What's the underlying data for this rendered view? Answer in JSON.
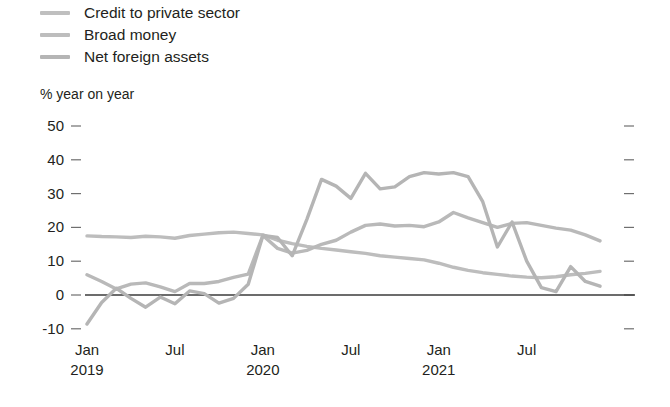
{
  "legend": {
    "position": "top-left",
    "items": [
      {
        "label": "Credit to private sector",
        "color": "#bfbfbf",
        "swatch_name": "legend-swatch-credit"
      },
      {
        "label": "Broad money",
        "color": "#bdbdbd",
        "swatch_name": "legend-swatch-broad-money"
      },
      {
        "label": "Net foreign assets",
        "color": "#b5b5b5",
        "swatch_name": "legend-swatch-net-foreign-assets"
      }
    ]
  },
  "axis_caption": "% year on year",
  "chart_data": {
    "type": "line",
    "title": "",
    "subtitle": "",
    "xlabel": "",
    "ylabel": "% year on year",
    "ylim": [
      -10,
      50
    ],
    "yticks": [
      50,
      40,
      30,
      20,
      10,
      0,
      -10
    ],
    "ytick_labels": [
      "50",
      "40",
      "30",
      "20",
      "10",
      "0",
      "-10"
    ],
    "grid": false,
    "zero_line": true,
    "right_ticks": true,
    "legend_position": "top-left",
    "x_tick_labels": [
      "Jan",
      "Jul",
      "Jan",
      "Jul",
      "Jan",
      "Jul"
    ],
    "x_tick_years": [
      "2019",
      "",
      "2020",
      "",
      "2021",
      ""
    ],
    "x": [
      "2019-01",
      "2019-02",
      "2019-03",
      "2019-04",
      "2019-05",
      "2019-06",
      "2019-07",
      "2019-08",
      "2019-09",
      "2019-10",
      "2019-11",
      "2019-12",
      "2020-01",
      "2020-02",
      "2020-03",
      "2020-04",
      "2020-05",
      "2020-06",
      "2020-07",
      "2020-08",
      "2020-09",
      "2020-10",
      "2020-11",
      "2020-12",
      "2021-01",
      "2021-02",
      "2021-03",
      "2021-04",
      "2021-05",
      "2021-06",
      "2021-07",
      "2021-08",
      "2021-09",
      "2021-10",
      "2021-11",
      "2021-12"
    ],
    "series": [
      {
        "name": "Credit to private sector",
        "color": "#bdbdbd",
        "values": [
          17.5,
          17.3,
          17.2,
          17.0,
          17.4,
          17.2,
          16.8,
          17.6,
          18.0,
          18.4,
          18.6,
          18.2,
          17.8,
          16.2,
          15.2,
          14.4,
          13.8,
          13.3,
          12.8,
          12.3,
          11.6,
          11.2,
          10.8,
          10.4,
          9.4,
          8.2,
          7.3,
          6.6,
          6.1,
          5.6,
          5.3,
          5.1,
          5.4,
          6.0,
          6.4,
          7.0
        ]
      },
      {
        "name": "Broad money",
        "color": "#b9b9b9",
        "values": [
          6.0,
          4.0,
          1.8,
          3.2,
          3.6,
          2.4,
          1.0,
          3.4,
          3.4,
          4.0,
          5.2,
          6.2,
          17.6,
          13.8,
          12.4,
          13.2,
          15.0,
          16.2,
          18.6,
          20.6,
          21.0,
          20.4,
          20.6,
          20.2,
          21.6,
          24.4,
          22.8,
          21.4,
          20.0,
          21.2,
          21.4,
          20.6,
          19.8,
          19.2,
          17.8,
          16.0
        ]
      },
      {
        "name": "Net foreign assets",
        "color": "#b5b5b5",
        "values": [
          -8.6,
          -2.2,
          2.0,
          -1.0,
          -3.6,
          -0.6,
          -2.6,
          1.2,
          0.4,
          -2.4,
          -1.0,
          3.2,
          17.6,
          17.0,
          11.6,
          22.4,
          34.2,
          32.2,
          28.6,
          36.0,
          31.4,
          32.0,
          35.0,
          36.2,
          35.8,
          36.2,
          35.0,
          27.6,
          14.2,
          21.6,
          10.0,
          2.2,
          1.0,
          8.4,
          4.0,
          2.6
        ]
      }
    ]
  }
}
